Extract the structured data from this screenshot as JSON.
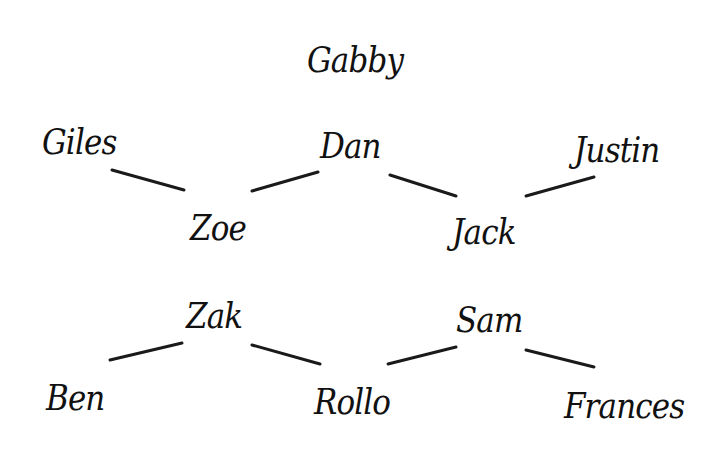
{
  "diagram": {
    "type": "name-relationship-diagram",
    "nodes": [
      {
        "id": "gabby",
        "label": "Gabby",
        "x": 307,
        "y": 42
      },
      {
        "id": "giles",
        "label": "Giles",
        "x": 42,
        "y": 124
      },
      {
        "id": "dan",
        "label": "Dan",
        "x": 320,
        "y": 128
      },
      {
        "id": "justin",
        "label": "Justin",
        "x": 574,
        "y": 132
      },
      {
        "id": "zoe",
        "label": "Zoe",
        "x": 190,
        "y": 210
      },
      {
        "id": "jack",
        "label": "Jack",
        "x": 452,
        "y": 214
      },
      {
        "id": "zak",
        "label": "Zak",
        "x": 186,
        "y": 298
      },
      {
        "id": "sam",
        "label": "Sam",
        "x": 456,
        "y": 302
      },
      {
        "id": "ben",
        "label": "Ben",
        "x": 46,
        "y": 380
      },
      {
        "id": "rollo",
        "label": "Rollo",
        "x": 314,
        "y": 384
      },
      {
        "id": "frances",
        "label": "Frances",
        "x": 564,
        "y": 388
      }
    ],
    "edges": [
      {
        "from": "giles",
        "to": "zoe",
        "x1": 112,
        "y1": 170,
        "x2": 184,
        "y2": 190
      },
      {
        "from": "dan",
        "to": "zoe",
        "x1": 252,
        "y1": 191,
        "x2": 318,
        "y2": 172
      },
      {
        "from": "dan",
        "to": "jack",
        "x1": 390,
        "y1": 175,
        "x2": 456,
        "y2": 196
      },
      {
        "from": "justin",
        "to": "jack",
        "x1": 526,
        "y1": 196,
        "x2": 594,
        "y2": 177
      },
      {
        "from": "zak",
        "to": "ben",
        "x1": 110,
        "y1": 360,
        "x2": 182,
        "y2": 343
      },
      {
        "from": "zak",
        "to": "rollo",
        "x1": 252,
        "y1": 345,
        "x2": 320,
        "y2": 364
      },
      {
        "from": "sam",
        "to": "rollo",
        "x1": 388,
        "y1": 364,
        "x2": 456,
        "y2": 347
      },
      {
        "from": "sam",
        "to": "frances",
        "x1": 526,
        "y1": 350,
        "x2": 594,
        "y2": 367
      }
    ],
    "colors": {
      "background": "#ffffff",
      "text": "#111111",
      "line": "#1a1a1a"
    }
  }
}
